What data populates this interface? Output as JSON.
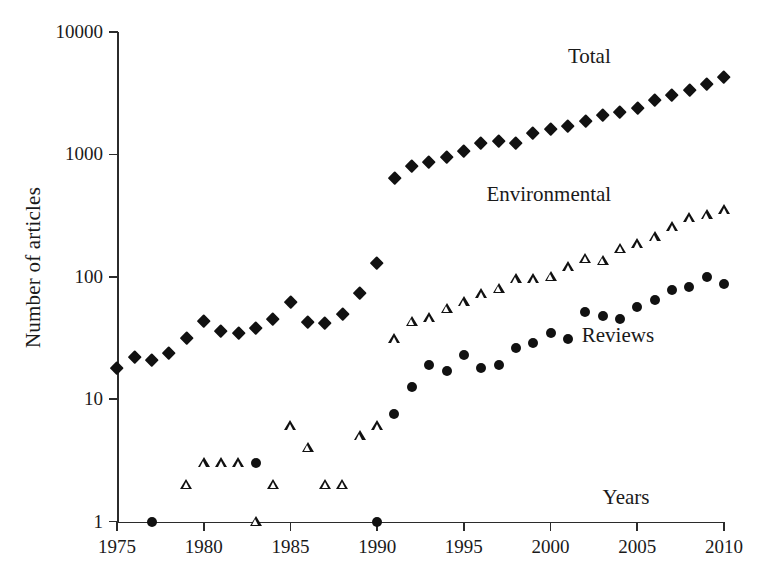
{
  "chart_data": {
    "type": "scatter",
    "title": "",
    "xlabel": "",
    "ylabel": "Number of articles",
    "xlim": [
      1975,
      2010
    ],
    "ylim": [
      1,
      10000
    ],
    "yscale": "log",
    "xscale": "linear",
    "grid": false,
    "legend_position": "in-plot annotations",
    "x_ticks": [
      "1975",
      "1980",
      "1985",
      "1990",
      "1995",
      "2000",
      "2005",
      "2010"
    ],
    "y_ticks": [
      "1",
      "10",
      "100",
      "1000",
      "10000"
    ],
    "annotations": [
      {
        "text": "Total",
        "x": 2001.0,
        "y": 6200
      },
      {
        "text": "Environmental",
        "x": 1996.3,
        "y": 470
      },
      {
        "text": "Reviews",
        "x": 2001.8,
        "y": 33
      },
      {
        "text": "Years",
        "x": 2003.0,
        "y": 1.55
      }
    ],
    "series": [
      {
        "name": "Total",
        "marker": "filled-diamond",
        "color": "#111111",
        "points": [
          {
            "x": 1975,
            "y": 18
          },
          {
            "x": 1976,
            "y": 22
          },
          {
            "x": 1977,
            "y": 21
          },
          {
            "x": 1978,
            "y": 24
          },
          {
            "x": 1979,
            "y": 32
          },
          {
            "x": 1980,
            "y": 44
          },
          {
            "x": 1981,
            "y": 36
          },
          {
            "x": 1982,
            "y": 35
          },
          {
            "x": 1983,
            "y": 38
          },
          {
            "x": 1984,
            "y": 45
          },
          {
            "x": 1985,
            "y": 63
          },
          {
            "x": 1986,
            "y": 43
          },
          {
            "x": 1987,
            "y": 42
          },
          {
            "x": 1988,
            "y": 50
          },
          {
            "x": 1989,
            "y": 74
          },
          {
            "x": 1990,
            "y": 130
          },
          {
            "x": 1991,
            "y": 650
          },
          {
            "x": 1992,
            "y": 800
          },
          {
            "x": 1993,
            "y": 870
          },
          {
            "x": 1994,
            "y": 960
          },
          {
            "x": 1995,
            "y": 1080
          },
          {
            "x": 1996,
            "y": 1250
          },
          {
            "x": 1997,
            "y": 1300
          },
          {
            "x": 1998,
            "y": 1250
          },
          {
            "x": 1999,
            "y": 1500
          },
          {
            "x": 2000,
            "y": 1620
          },
          {
            "x": 2001,
            "y": 1700
          },
          {
            "x": 2002,
            "y": 1900
          },
          {
            "x": 2003,
            "y": 2100
          },
          {
            "x": 2004,
            "y": 2250
          },
          {
            "x": 2005,
            "y": 2400
          },
          {
            "x": 2006,
            "y": 2800
          },
          {
            "x": 2007,
            "y": 3050
          },
          {
            "x": 2008,
            "y": 3400
          },
          {
            "x": 2009,
            "y": 3800
          },
          {
            "x": 2010,
            "y": 4300
          }
        ]
      },
      {
        "name": "Environmental",
        "marker": "hollow-triangle",
        "color": "#111111",
        "points": [
          {
            "x": 1979,
            "y": 2
          },
          {
            "x": 1980,
            "y": 3
          },
          {
            "x": 1981,
            "y": 3
          },
          {
            "x": 1982,
            "y": 3
          },
          {
            "x": 1983,
            "y": 1
          },
          {
            "x": 1984,
            "y": 2
          },
          {
            "x": 1985,
            "y": 6
          },
          {
            "x": 1986,
            "y": 4
          },
          {
            "x": 1987,
            "y": 2
          },
          {
            "x": 1988,
            "y": 2
          },
          {
            "x": 1989,
            "y": 5
          },
          {
            "x": 1990,
            "y": 6
          },
          {
            "x": 1991,
            "y": 31
          },
          {
            "x": 1992,
            "y": 43
          },
          {
            "x": 1993,
            "y": 46
          },
          {
            "x": 1994,
            "y": 55
          },
          {
            "x": 1995,
            "y": 62
          },
          {
            "x": 1996,
            "y": 72
          },
          {
            "x": 1997,
            "y": 80
          },
          {
            "x": 1998,
            "y": 95
          },
          {
            "x": 1999,
            "y": 96
          },
          {
            "x": 2000,
            "y": 100
          },
          {
            "x": 2001,
            "y": 120
          },
          {
            "x": 2002,
            "y": 140
          },
          {
            "x": 2003,
            "y": 135
          },
          {
            "x": 2004,
            "y": 170
          },
          {
            "x": 2005,
            "y": 185
          },
          {
            "x": 2006,
            "y": 210
          },
          {
            "x": 2007,
            "y": 255
          },
          {
            "x": 2008,
            "y": 300
          },
          {
            "x": 2009,
            "y": 320
          },
          {
            "x": 2010,
            "y": 350
          }
        ]
      },
      {
        "name": "Reviews",
        "marker": "filled-circle",
        "color": "#111111",
        "points": [
          {
            "x": 1977,
            "y": 1
          },
          {
            "x": 1983,
            "y": 3
          },
          {
            "x": 1990,
            "y": 1
          },
          {
            "x": 1991,
            "y": 7.5
          },
          {
            "x": 1992,
            "y": 12.5
          },
          {
            "x": 1993,
            "y": 19
          },
          {
            "x": 1994,
            "y": 17
          },
          {
            "x": 1995,
            "y": 23
          },
          {
            "x": 1996,
            "y": 18
          },
          {
            "x": 1997,
            "y": 19
          },
          {
            "x": 1998,
            "y": 26
          },
          {
            "x": 1999,
            "y": 29
          },
          {
            "x": 2000,
            "y": 35
          },
          {
            "x": 2001,
            "y": 31
          },
          {
            "x": 2002,
            "y": 52
          },
          {
            "x": 2003,
            "y": 48
          },
          {
            "x": 2004,
            "y": 45
          },
          {
            "x": 2005,
            "y": 57
          },
          {
            "x": 2006,
            "y": 65
          },
          {
            "x": 2007,
            "y": 78
          },
          {
            "x": 2008,
            "y": 82
          },
          {
            "x": 2009,
            "y": 100
          },
          {
            "x": 2010,
            "y": 88
          }
        ]
      }
    ]
  }
}
